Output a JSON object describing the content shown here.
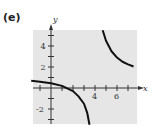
{
  "panel_label": "(e)",
  "chart_data": {
    "type": "line",
    "title": "",
    "xlabel": "x",
    "ylabel": "y",
    "xlim": [
      -1.8,
      7.8
    ],
    "ylim": [
      -3.5,
      5.5
    ],
    "x_ticks": [
      -1,
      1,
      2,
      3,
      4,
      5,
      6,
      7
    ],
    "x_tick_labels": {
      "4": "4",
      "6": "6"
    },
    "y_ticks": [
      -3,
      -2,
      -1,
      1,
      2,
      3,
      4,
      5
    ],
    "y_tick_labels": {
      "-2": "-2",
      "2": "2",
      "4": "4"
    },
    "grid": false,
    "background": "#e6e6e6",
    "series": [
      {
        "name": "left branch",
        "x": [
          -1.8,
          -1,
          0,
          1,
          2,
          2.5,
          3,
          3.3,
          3.5
        ],
        "y": [
          0.7,
          0.6,
          0.45,
          0.2,
          -0.3,
          -0.8,
          -1.5,
          -2.4,
          -3.5
        ]
      },
      {
        "name": "right branch",
        "x": [
          4.7,
          5,
          5.5,
          6,
          6.5,
          7,
          7.5
        ],
        "y": [
          5.5,
          4.5,
          3.5,
          2.9,
          2.5,
          2.25,
          2.05
        ]
      }
    ],
    "asymptote_x": 4
  }
}
